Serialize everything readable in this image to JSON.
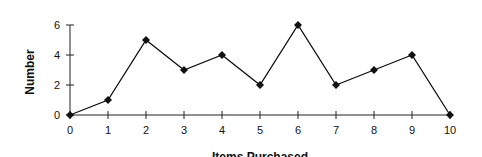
{
  "chart_data": {
    "type": "line",
    "title": "",
    "xlabel": "Items Purchased",
    "ylabel": "Number",
    "x": [
      0,
      1,
      2,
      3,
      4,
      5,
      6,
      7,
      8,
      9,
      10
    ],
    "series": [
      {
        "name": "Number",
        "values": [
          0,
          1,
          5,
          3,
          4,
          2,
          6,
          2,
          3,
          4,
          0
        ],
        "marker": "diamond",
        "color": "#111111"
      }
    ],
    "xlim": [
      0,
      10
    ],
    "ylim": [
      0,
      6
    ],
    "xticks": [
      0,
      1,
      2,
      3,
      4,
      5,
      6,
      7,
      8,
      9,
      10
    ],
    "yticks": [
      0,
      2,
      4,
      6
    ],
    "grid": false,
    "legend": null
  }
}
